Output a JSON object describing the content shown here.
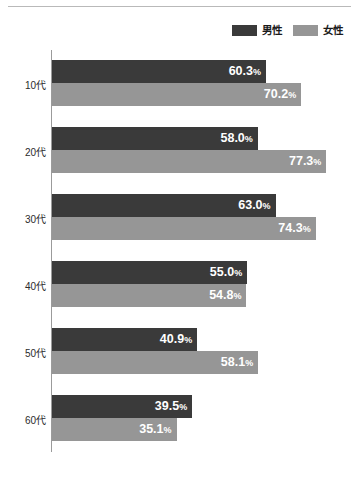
{
  "chart_data": {
    "type": "bar",
    "orientation": "horizontal",
    "title": "",
    "subtitle": "",
    "xlabel": "",
    "ylabel": "",
    "xlim": [
      0,
      86.5
    ],
    "grid": false,
    "legend_position": "top-right",
    "categories": [
      "10代",
      "20代",
      "30代",
      "40代",
      "50代",
      "60代"
    ],
    "value_suffix": "%",
    "series": [
      {
        "name": "男性",
        "color": "#3a3a3a",
        "values": [
          60.3,
          58.0,
          63.0,
          55.0,
          40.9,
          39.5
        ],
        "labels": [
          "60.3%",
          "58.0%",
          "63.0%",
          "55.0%",
          "40.9%",
          "39.5%"
        ]
      },
      {
        "name": "女性",
        "color": "#969696",
        "values": [
          70.2,
          77.3,
          74.3,
          54.8,
          58.1,
          35.1
        ],
        "labels": [
          "70.2%",
          "77.3%",
          "74.3%",
          "54.8%",
          "58.1%",
          "35.1%"
        ]
      }
    ]
  },
  "legend": {
    "items": [
      {
        "label": "男性",
        "color": "#3a3a3a"
      },
      {
        "label": "女性",
        "color": "#969696"
      }
    ]
  },
  "axis": {
    "category_labels": [
      "10代",
      "20代",
      "30代",
      "40代",
      "50代",
      "60代"
    ]
  },
  "colors": {
    "male_bar": "#3a3a3a",
    "female_bar": "#969696",
    "axis_line": "#9b9b9b",
    "top_rule": "#b9b9b9",
    "label_text": "#2b2b2b",
    "value_text": "#ffffff",
    "background": "#ffffff"
  }
}
